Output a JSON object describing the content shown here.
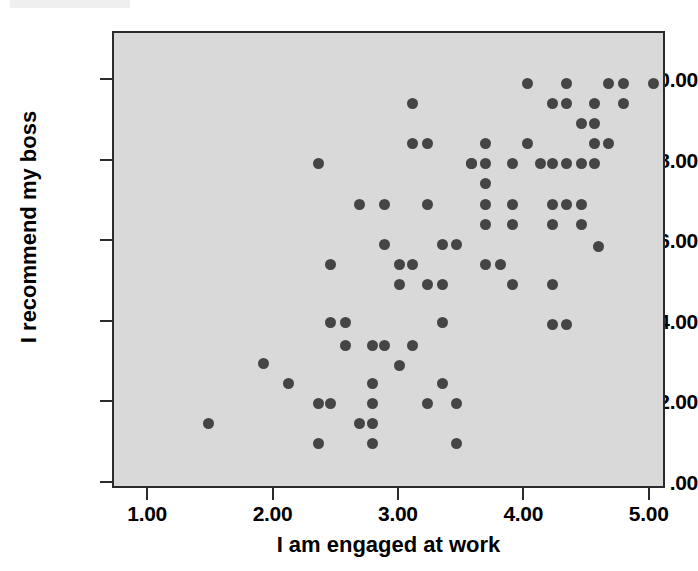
{
  "chart_data": {
    "type": "scatter",
    "title": "",
    "xlabel": "I am engaged at work",
    "ylabel": "I recommend my boss",
    "xlim": [
      0.72,
      5.13
    ],
    "ylim": [
      -0.15,
      11.2
    ],
    "grid": false,
    "legend": null,
    "xticks": [
      1.0,
      2.0,
      3.0,
      4.0,
      5.0
    ],
    "yticks": [
      0.0,
      2.0,
      4.0,
      6.0,
      8.0,
      10.0
    ],
    "xtick_labels": [
      "1.00",
      "2.00",
      "3.00",
      "4.00",
      "5.00"
    ],
    "ytick_labels": [
      ".00",
      "2.00",
      "4.00",
      "6.00",
      "8.00",
      "10.00"
    ],
    "marker": {
      "shape": "circle",
      "color": "#454545",
      "size_px": 11
    },
    "plot_background": "#d9d9d9",
    "frame_color": "#2b2b2b",
    "n_points": 104,
    "points": [
      [
        1.47,
        1.5
      ],
      [
        1.91,
        3.0
      ],
      [
        2.11,
        2.5
      ],
      [
        2.35,
        7.95
      ],
      [
        2.35,
        2.0
      ],
      [
        2.35,
        1.0
      ],
      [
        2.45,
        5.45
      ],
      [
        2.45,
        4.0
      ],
      [
        2.45,
        2.0
      ],
      [
        2.57,
        3.45
      ],
      [
        2.57,
        4.0
      ],
      [
        2.68,
        6.95
      ],
      [
        2.68,
        1.5
      ],
      [
        2.78,
        3.45
      ],
      [
        2.78,
        2.5
      ],
      [
        2.78,
        2.0
      ],
      [
        2.78,
        1.5
      ],
      [
        2.78,
        1.0
      ],
      [
        2.88,
        5.95
      ],
      [
        2.88,
        6.95
      ],
      [
        2.88,
        3.45
      ],
      [
        3.0,
        5.45
      ],
      [
        3.0,
        4.95
      ],
      [
        3.0,
        2.95
      ],
      [
        3.1,
        9.45
      ],
      [
        3.1,
        8.45
      ],
      [
        3.1,
        5.45
      ],
      [
        3.1,
        3.45
      ],
      [
        3.22,
        8.45
      ],
      [
        3.22,
        6.95
      ],
      [
        3.22,
        4.95
      ],
      [
        3.22,
        2.0
      ],
      [
        3.34,
        5.95
      ],
      [
        3.34,
        4.95
      ],
      [
        3.34,
        4.0
      ],
      [
        3.34,
        2.5
      ],
      [
        3.45,
        5.95
      ],
      [
        3.45,
        2.0
      ],
      [
        3.45,
        1.0
      ],
      [
        3.57,
        7.95
      ],
      [
        3.57,
        7.95
      ],
      [
        3.68,
        8.45
      ],
      [
        3.68,
        7.95
      ],
      [
        3.68,
        7.45
      ],
      [
        3.68,
        6.95
      ],
      [
        3.68,
        6.45
      ],
      [
        3.68,
        5.45
      ],
      [
        3.8,
        5.45
      ],
      [
        3.9,
        7.95
      ],
      [
        3.9,
        6.95
      ],
      [
        3.9,
        6.45
      ],
      [
        3.9,
        4.95
      ],
      [
        4.02,
        9.95
      ],
      [
        4.02,
        8.45
      ],
      [
        4.12,
        7.95
      ],
      [
        4.22,
        7.95
      ],
      [
        4.22,
        6.95
      ],
      [
        4.22,
        6.45
      ],
      [
        4.22,
        4.95
      ],
      [
        4.22,
        3.95
      ],
      [
        4.22,
        9.45
      ],
      [
        4.33,
        9.95
      ],
      [
        4.33,
        9.45
      ],
      [
        4.33,
        7.95
      ],
      [
        4.33,
        6.95
      ],
      [
        4.33,
        3.95
      ],
      [
        4.45,
        8.95
      ],
      [
        4.45,
        7.95
      ],
      [
        4.45,
        6.45
      ],
      [
        4.45,
        6.95
      ],
      [
        4.55,
        8.95
      ],
      [
        4.55,
        9.45
      ],
      [
        4.55,
        8.45
      ],
      [
        4.55,
        7.95
      ],
      [
        4.58,
        5.9
      ],
      [
        4.66,
        9.95
      ],
      [
        4.66,
        8.45
      ],
      [
        4.78,
        9.95
      ],
      [
        4.78,
        9.45
      ],
      [
        5.02,
        9.95
      ]
    ]
  },
  "axes": {
    "y_title": "I recommend my boss",
    "x_title": "I am engaged at work",
    "y_ticks": [
      {
        "value": 10.0,
        "label": "10.00"
      },
      {
        "value": 8.0,
        "label": "8.00"
      },
      {
        "value": 6.0,
        "label": "6.00"
      },
      {
        "value": 4.0,
        "label": "4.00"
      },
      {
        "value": 2.0,
        "label": "2.00"
      },
      {
        "value": 0.0,
        "label": ".00"
      }
    ],
    "x_ticks": [
      {
        "value": 1.0,
        "label": "1.00"
      },
      {
        "value": 2.0,
        "label": "2.00"
      },
      {
        "value": 3.0,
        "label": "3.00"
      },
      {
        "value": 4.0,
        "label": "4.00"
      },
      {
        "value": 5.0,
        "label": "5.00"
      }
    ]
  },
  "colors": {
    "marker": "#454545",
    "plot_background": "#d9d9d9",
    "frame": "#2b2b2b",
    "page_background": "#ffffff",
    "text": "#000000"
  }
}
